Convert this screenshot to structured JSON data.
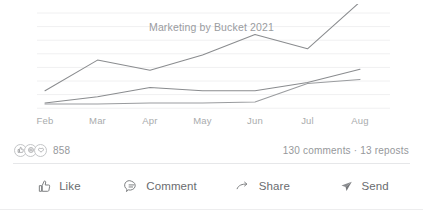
{
  "top_sliver": {
    "text": "•••  ••••••  ••••  •••••  •••"
  },
  "chart_data": {
    "type": "line",
    "title": "Marketing by Bucket 2021",
    "xlabel": "",
    "ylabel": "",
    "categories": [
      "Feb",
      "Mar",
      "Apr",
      "May",
      "Jun",
      "Jul",
      "Aug"
    ],
    "x_tick_labels": [
      "Feb",
      "Mar",
      "Apr",
      "May",
      "Jun",
      "Jul",
      "Aug"
    ],
    "grid": true,
    "grid_orientation": "horizontal",
    "gridline_count": 8,
    "legend": "none",
    "ylim": [
      0,
      100
    ],
    "series": [
      {
        "name": "Bucket 1",
        "color": "#8a8c8f",
        "values": [
          17,
          47,
          37,
          52,
          72,
          58,
          104
        ]
      },
      {
        "name": "Bucket 2",
        "color": "#8a8c8f",
        "values": [
          5,
          11,
          20,
          17,
          17,
          25,
          38
        ]
      },
      {
        "name": "Bucket 3",
        "color": "#9a9c9f",
        "values": [
          4,
          4,
          5,
          5,
          6,
          24,
          28
        ]
      }
    ]
  },
  "engagement": {
    "reaction_icons": [
      "like-reaction-icon",
      "celebrate-reaction-icon",
      "love-reaction-icon"
    ],
    "reaction_count": "858",
    "meta_counts": "130 comments · 13 reposts"
  },
  "actions": [
    {
      "icon": "thumbs-up-icon",
      "label": "Like",
      "name": "like-button"
    },
    {
      "icon": "comment-bubble-icon",
      "label": "Comment",
      "name": "comment-button"
    },
    {
      "icon": "share-arrow-icon",
      "label": "Share",
      "name": "share-button"
    },
    {
      "icon": "send-paper-plane-icon",
      "label": "Send",
      "name": "send-button"
    }
  ],
  "colors": {
    "line": "#8a8c8f",
    "grid": "#f0f0f1",
    "text_muted": "#96989b",
    "text_label": "#6a6c6f"
  }
}
